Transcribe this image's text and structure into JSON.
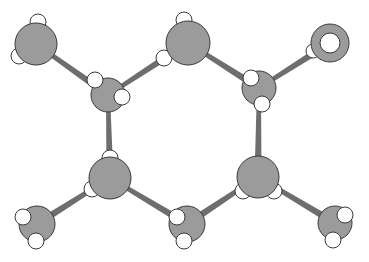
{
  "diagram": {
    "title": "",
    "type": "ball-and-stick molecular model",
    "colors": {
      "background": "#ffffff",
      "heavy_atom": "#9b9b9b",
      "hydrogen": "#ffffff",
      "bond": "#6e6e6e",
      "outline": "#3a3a3a"
    },
    "atoms": [
      {
        "id": "A",
        "kind": "heavy",
        "label": "top-left-atom"
      },
      {
        "id": "B",
        "kind": "heavy",
        "label": "upper-left-carbon"
      },
      {
        "id": "C",
        "kind": "heavy",
        "label": "top-middle-atom"
      },
      {
        "id": "D",
        "kind": "heavy",
        "label": "upper-right-carbon"
      },
      {
        "id": "O",
        "kind": "ring",
        "label": "top-right-ring-atom"
      },
      {
        "id": "E",
        "kind": "heavy",
        "label": "lower-left-carbon"
      },
      {
        "id": "F",
        "kind": "heavy",
        "label": "lower-right-carbon"
      },
      {
        "id": "G",
        "kind": "heavy",
        "label": "bottom-left-atom"
      },
      {
        "id": "I",
        "kind": "heavy",
        "label": "bottom-middle-atom"
      },
      {
        "id": "J",
        "kind": "heavy",
        "label": "bottom-right-atom"
      }
    ],
    "bonds": [
      [
        "A",
        "B"
      ],
      [
        "B",
        "C"
      ],
      [
        "C",
        "D"
      ],
      [
        "D",
        "O"
      ],
      [
        "B",
        "E"
      ],
      [
        "D",
        "F"
      ],
      [
        "E",
        "G"
      ],
      [
        "E",
        "I"
      ],
      [
        "F",
        "I"
      ],
      [
        "F",
        "J"
      ]
    ],
    "hydrogen_counts": {
      "A": 2,
      "B": 2,
      "C": 2,
      "D": 2,
      "O": 1,
      "E": 2,
      "F": 2,
      "G": 2,
      "I": 2,
      "J": 2
    }
  }
}
